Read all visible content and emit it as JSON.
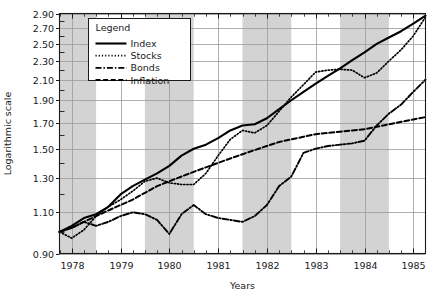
{
  "chart_data": {
    "type": "line",
    "title": "",
    "xlabel": "Years",
    "ylabel": "Logarithmic scale",
    "yscale": "log",
    "ylim": [
      0.9,
      2.9
    ],
    "xlim": [
      1977.75,
      1985.25
    ],
    "grid": true,
    "legend": {
      "title": "Legend",
      "position": "top-left-inside",
      "entries": [
        "Index",
        "Stocks",
        "Bonds",
        "Inflation"
      ]
    },
    "y_ticks": [
      0.9,
      1.1,
      1.3,
      1.5,
      1.7,
      1.9,
      2.1,
      2.3,
      2.5,
      2.7,
      2.9
    ],
    "y_tick_labels": [
      "0.90",
      "1.10",
      "1.30",
      "1.50",
      "1.70",
      "1.90",
      "2.10",
      "2.30",
      "2.50",
      "2.70",
      "2.90"
    ],
    "x_ticks": [
      1978,
      1979,
      1980,
      1981,
      1982,
      1983,
      1984,
      1985
    ],
    "x_tick_labels": [
      "1978",
      "1979",
      "1980",
      "1981",
      "1982",
      "1983",
      "1984",
      "1985"
    ],
    "x_minor_ticks_per_year": 4,
    "shaded_bands": [
      {
        "start": 1977.75,
        "end": 1978.5
      },
      {
        "start": 1979.5,
        "end": 1980.5
      },
      {
        "start": 1981.5,
        "end": 1982.5
      },
      {
        "start": 1983.5,
        "end": 1984.5
      }
    ],
    "shaded_band_color": "#d3d3d3",
    "plot_bg_color": "#ffffff",
    "grid_color": "#9a9a9a",
    "axis_color": "#1a1a1a",
    "series": [
      {
        "name": "Index",
        "style": "solid",
        "color": "#000000",
        "x": [
          1977.75,
          1978.0,
          1978.25,
          1978.5,
          1978.75,
          1979.0,
          1979.25,
          1979.5,
          1979.75,
          1980.0,
          1980.25,
          1980.5,
          1980.75,
          1981.0,
          1981.25,
          1981.5,
          1981.75,
          1982.0,
          1982.25,
          1982.5,
          1982.75,
          1983.0,
          1983.25,
          1983.5,
          1983.75,
          1984.0,
          1984.25,
          1984.5,
          1984.75,
          1985.0,
          1985.25
        ],
        "y": [
          1.0,
          1.03,
          1.07,
          1.09,
          1.13,
          1.2,
          1.25,
          1.29,
          1.33,
          1.38,
          1.45,
          1.5,
          1.53,
          1.58,
          1.64,
          1.68,
          1.69,
          1.74,
          1.82,
          1.9,
          1.98,
          2.06,
          2.14,
          2.22,
          2.31,
          2.4,
          2.5,
          2.58,
          2.66,
          2.76,
          2.87
        ]
      },
      {
        "name": "Stocks",
        "style": "dotted",
        "color": "#000000",
        "x": [
          1977.75,
          1978.0,
          1978.25,
          1978.5,
          1978.75,
          1979.0,
          1979.25,
          1979.5,
          1979.75,
          1980.0,
          1980.25,
          1980.5,
          1980.75,
          1981.0,
          1981.25,
          1981.5,
          1981.75,
          1982.0,
          1982.25,
          1982.5,
          1982.75,
          1983.0,
          1983.25,
          1983.5,
          1983.75,
          1984.0,
          1984.25,
          1984.5,
          1984.75,
          1985.0,
          1985.25
        ],
        "y": [
          1.0,
          0.97,
          1.01,
          1.08,
          1.13,
          1.17,
          1.22,
          1.28,
          1.3,
          1.27,
          1.26,
          1.26,
          1.33,
          1.45,
          1.57,
          1.64,
          1.62,
          1.68,
          1.8,
          1.93,
          2.05,
          2.18,
          2.2,
          2.21,
          2.2,
          2.12,
          2.17,
          2.3,
          2.43,
          2.6,
          2.85
        ]
      },
      {
        "name": "Bonds",
        "style": "dashdot",
        "color": "#000000",
        "x": [
          1977.75,
          1978.0,
          1978.25,
          1978.5,
          1978.75,
          1979.0,
          1979.25,
          1979.5,
          1979.75,
          1980.0,
          1980.25,
          1980.5,
          1980.75,
          1981.0,
          1981.25,
          1981.5,
          1981.75,
          1982.0,
          1982.25,
          1982.5,
          1982.75,
          1983.0,
          1983.25,
          1983.5,
          1983.75,
          1984.0,
          1984.25,
          1984.5,
          1984.75,
          1985.0,
          1985.25
        ],
        "y": [
          1.0,
          1.02,
          1.05,
          1.03,
          1.05,
          1.08,
          1.1,
          1.09,
          1.06,
          0.99,
          1.09,
          1.14,
          1.09,
          1.07,
          1.06,
          1.05,
          1.08,
          1.14,
          1.25,
          1.31,
          1.47,
          1.5,
          1.52,
          1.53,
          1.54,
          1.56,
          1.68,
          1.78,
          1.86,
          1.98,
          2.1
        ]
      },
      {
        "name": "Inflation",
        "style": "dashed",
        "color": "#000000",
        "x": [
          1977.75,
          1978.0,
          1978.25,
          1978.5,
          1978.75,
          1979.0,
          1979.25,
          1979.5,
          1979.75,
          1980.0,
          1980.25,
          1980.5,
          1980.75,
          1981.0,
          1981.25,
          1981.5,
          1981.75,
          1982.0,
          1982.25,
          1982.5,
          1982.75,
          1983.0,
          1983.25,
          1983.5,
          1983.75,
          1984.0,
          1984.25,
          1984.5,
          1984.75,
          1985.0,
          1985.25
        ],
        "y": [
          1.0,
          1.02,
          1.05,
          1.08,
          1.11,
          1.14,
          1.17,
          1.21,
          1.25,
          1.28,
          1.31,
          1.34,
          1.37,
          1.4,
          1.43,
          1.46,
          1.49,
          1.52,
          1.55,
          1.57,
          1.59,
          1.61,
          1.62,
          1.63,
          1.64,
          1.65,
          1.67,
          1.69,
          1.71,
          1.73,
          1.75
        ]
      }
    ]
  }
}
